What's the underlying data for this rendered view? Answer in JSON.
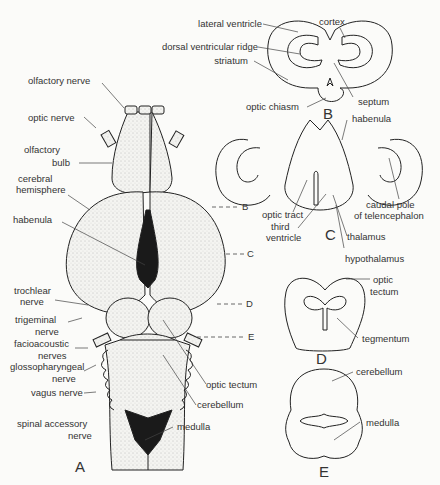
{
  "figure": {
    "panels": {
      "A": "A",
      "B": "B",
      "C": "C",
      "D": "D",
      "E": "E"
    },
    "section_markers": [
      "B",
      "C",
      "D",
      "E"
    ],
    "panel_A_labels": {
      "olfactory_nerve": "olfactory nerve",
      "optic_nerve": "optic nerve",
      "olfactory_bulb_1": "olfactory",
      "olfactory_bulb_2": "bulb",
      "cerebral_hemisphere_1": "cerebral",
      "cerebral_hemisphere_2": "hemisphere",
      "habenula": "habenula",
      "trochlear_1": "trochlear",
      "trochlear_2": "nerve",
      "trigeminal_1": "trigeminal",
      "trigeminal_2": "nerve",
      "facioacoustic_1": "facioacoustic",
      "facioacoustic_2": "nerves",
      "glosso_1": "glossopharyngeal",
      "glosso_2": "nerve",
      "vagus": "vagus nerve",
      "spinal_1": "spinal accessory",
      "spinal_2": "nerve",
      "optic_tectum": "optic tectum",
      "cerebellum": "cerebellum",
      "medulla": "medulla"
    },
    "panel_B_labels": {
      "lateral_ventricle": "lateral ventricle",
      "dorsal_ventricular_ridge": "dorsal ventricular ridge",
      "striatum": "striatum",
      "optic_chiasm": "optic chiasm",
      "cortex": "cortex",
      "septum": "septum"
    },
    "panel_C_labels": {
      "habenula": "habenula",
      "optic_tract": "optic tract",
      "third_ventricle_1": "third",
      "third_ventricle_2": "ventricle",
      "thalamus": "thalamus",
      "hypothalamus": "hypothalamus",
      "caudal_pole_1": "caudal pole",
      "caudal_pole_2": "of telencephalon"
    },
    "panel_D_labels": {
      "optic_tectum_1": "optic",
      "optic_tectum_2": "tectum",
      "tegmentum": "tegmentum"
    },
    "panel_E_labels": {
      "cerebellum": "cerebellum",
      "medulla": "medulla"
    }
  }
}
